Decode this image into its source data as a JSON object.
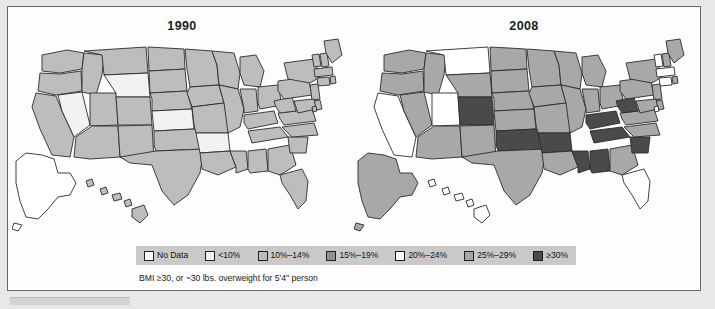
{
  "figure": {
    "caption": "BMI ≥30, or ~30 lbs. overweight for 5'4\" person"
  },
  "panels": [
    {
      "title": "1990",
      "name": "map-panel-1990"
    },
    {
      "title": "2008",
      "name": "map-panel-2008"
    }
  ],
  "legend": {
    "items": [
      {
        "label": "No Data",
        "color": "#ffffff"
      },
      {
        "label": "<10%",
        "color": "#f2f2f2"
      },
      {
        "label": "10%–14%",
        "color": "#bdbdbd"
      },
      {
        "label": "15%–19%",
        "color": "#8f8f8f"
      },
      {
        "label": "20%–24%",
        "color": "#ffffff"
      },
      {
        "label": "25%–29%",
        "color": "#a8a8a8"
      },
      {
        "label": "≥30%",
        "color": "#4a4a4a"
      }
    ]
  },
  "palette": {
    "no_data": "#ffffff",
    "lt10": "#f2f2f2",
    "b10_14": "#bdbdbd",
    "b15_19": "#8f8f8f",
    "b20_24": "#ffffff",
    "b25_29": "#a8a8a8",
    "gte30": "#4a4a4a",
    "stroke": "#2b2b2b",
    "legend_band": "#c9c9c9",
    "frame_bg": "#fdfdfd",
    "page_bg": "#e8e8e8"
  },
  "chart_data": {
    "type": "choropleth-map",
    "subtitle": "BMI ≥30, or ~30 lbs. overweight for 5'4\" person",
    "categories": [
      "No Data",
      "<10%",
      "10%–14%",
      "15%–19%",
      "20%–24%",
      "25%–29%",
      "≥30%"
    ],
    "legend_position": "bottom",
    "grid": false,
    "series": [
      {
        "name": "1990",
        "values": {
          "AK": "No Data",
          "AL": "10%–14%",
          "AR": "<10%",
          "AZ": "10%–14%",
          "CA": "10%–14%",
          "CO": "10%–14%",
          "CT": "10%–14%",
          "DC": "10%–14%",
          "DE": "10%–14%",
          "FL": "10%–14%",
          "GA": "10%–14%",
          "HI": "10%–14%",
          "IA": "10%–14%",
          "ID": "10%–14%",
          "IL": "10%–14%",
          "IN": "10%–14%",
          "KS": "<10%",
          "KY": "10%–14%",
          "LA": "10%–14%",
          "MA": "10%–14%",
          "MD": "10%–14%",
          "ME": "10%–14%",
          "MI": "10%–14%",
          "MN": "10%–14%",
          "MO": "10%–14%",
          "MS": "10%–14%",
          "MT": "10%–14%",
          "NC": "10%–14%",
          "ND": "10%–14%",
          "NE": "10%–14%",
          "NH": "10%–14%",
          "NJ": "10%–14%",
          "NM": "10%–14%",
          "NV": "<10%",
          "NY": "10%–14%",
          "OH": "10%–14%",
          "OK": "10%–14%",
          "OR": "10%–14%",
          "PA": "10%–14%",
          "RI": "10%–14%",
          "SC": "10%–14%",
          "SD": "10%–14%",
          "TN": "10%–14%",
          "TX": "10%–14%",
          "UT": "10%–14%",
          "VA": "10%–14%",
          "VT": "10%–14%",
          "WA": "10%–14%",
          "WI": "10%–14%",
          "WV": "10%–14%",
          "WY": "<10%"
        }
      },
      {
        "name": "2008",
        "values": {
          "AK": "25%–29%",
          "AL": "≥30%",
          "AR": "≥30%",
          "AZ": "25%–29%",
          "CA": "20%–24%",
          "CO": "≥30%",
          "CT": "20%–24%",
          "DC": "20%–24%",
          "DE": "25%–29%",
          "FL": "20%–24%",
          "GA": "25%–29%",
          "HI": "20%–24%",
          "IA": "25%–29%",
          "ID": "25%–29%",
          "IL": "25%–29%",
          "IN": "25%–29%",
          "KS": "25%–29%",
          "KY": "≥30%",
          "LA": "25%–29%",
          "MA": "20%–24%",
          "MD": "25%–29%",
          "ME": "25%–29%",
          "MI": "25%–29%",
          "MN": "25%–29%",
          "MO": "25%–29%",
          "MS": "≥30%",
          "MT": "20%–24%",
          "NC": "25%–29%",
          "ND": "25%–29%",
          "NE": "25%–29%",
          "NH": "25%–29%",
          "NJ": "25%–29%",
          "NM": "25%–29%",
          "NV": "25%–29%",
          "NY": "25%–29%",
          "OH": "25%–29%",
          "OK": "≥30%",
          "OR": "25%–29%",
          "PA": "25%–29%",
          "RI": "25%–29%",
          "SC": "≥30%",
          "SD": "25%–29%",
          "TN": "≥30%",
          "TX": "25%–29%",
          "UT": "20%–24%",
          "VA": "25%–29%",
          "VT": "20%–24%",
          "WA": "25%–29%",
          "WI": "25%–29%",
          "WV": "≥30%",
          "WY": "25%–29%"
        }
      }
    ]
  }
}
